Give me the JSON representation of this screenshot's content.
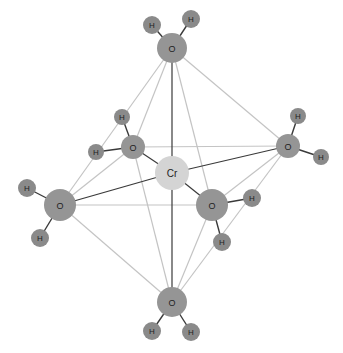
{
  "title": "Hexaaquachromium complex [Cr(H2O)6] octahedral structure",
  "colors": {
    "background": "#ffffff",
    "cr_fill": "#d4d4d4",
    "o_fill": "#959595",
    "h_fill": "#8a8a8a",
    "bond_dark": "#3a3a3a",
    "edge_light": "#c4c4c4",
    "label": "#222222"
  },
  "atoms": [
    {
      "id": "cr",
      "label": "Cr",
      "x": 172,
      "y": 173,
      "r": 17,
      "type": "cr"
    },
    {
      "id": "o_top",
      "label": "O",
      "x": 172,
      "y": 48,
      "r": 15,
      "type": "o"
    },
    {
      "id": "o_bottom",
      "label": "O",
      "x": 172,
      "y": 302,
      "r": 15,
      "type": "o"
    },
    {
      "id": "o_left",
      "label": "O",
      "x": 60,
      "y": 205,
      "r": 16,
      "type": "o"
    },
    {
      "id": "o_right",
      "label": "O",
      "x": 288,
      "y": 146,
      "r": 12,
      "type": "o"
    },
    {
      "id": "o_back",
      "label": "O",
      "x": 133,
      "y": 147,
      "r": 12,
      "type": "o"
    },
    {
      "id": "o_front",
      "label": "O",
      "x": 212,
      "y": 205,
      "r": 16,
      "type": "o"
    },
    {
      "id": "h_top_1",
      "label": "H",
      "x": 152,
      "y": 25,
      "r": 9,
      "type": "h"
    },
    {
      "id": "h_top_2",
      "label": "H",
      "x": 191,
      "y": 19,
      "r": 9,
      "type": "h"
    },
    {
      "id": "h_back_1",
      "label": "H",
      "x": 122,
      "y": 117,
      "r": 8,
      "type": "h"
    },
    {
      "id": "h_back_2",
      "label": "H",
      "x": 96,
      "y": 152,
      "r": 8,
      "type": "h"
    },
    {
      "id": "h_right_1",
      "label": "H",
      "x": 298,
      "y": 116,
      "r": 8,
      "type": "h"
    },
    {
      "id": "h_right_2",
      "label": "H",
      "x": 321,
      "y": 157,
      "r": 8,
      "type": "h"
    },
    {
      "id": "h_left_1",
      "label": "H",
      "x": 27,
      "y": 188,
      "r": 9,
      "type": "h"
    },
    {
      "id": "h_left_2",
      "label": "H",
      "x": 40,
      "y": 238,
      "r": 9,
      "type": "h"
    },
    {
      "id": "h_front_1",
      "label": "H",
      "x": 252,
      "y": 198,
      "r": 9,
      "type": "h"
    },
    {
      "id": "h_front_2",
      "label": "H",
      "x": 222,
      "y": 242,
      "r": 9,
      "type": "h"
    },
    {
      "id": "h_bottom_1",
      "label": "H",
      "x": 152,
      "y": 331,
      "r": 9,
      "type": "h"
    },
    {
      "id": "h_bottom_2",
      "label": "H",
      "x": 191,
      "y": 332,
      "r": 9,
      "type": "h"
    }
  ],
  "edges": [
    {
      "from": "o_top",
      "to": "o_left"
    },
    {
      "from": "o_top",
      "to": "o_back"
    },
    {
      "from": "o_top",
      "to": "o_right"
    },
    {
      "from": "o_top",
      "to": "o_front"
    },
    {
      "from": "o_bottom",
      "to": "o_left"
    },
    {
      "from": "o_bottom",
      "to": "o_back"
    },
    {
      "from": "o_bottom",
      "to": "o_right"
    },
    {
      "from": "o_bottom",
      "to": "o_front"
    },
    {
      "from": "o_left",
      "to": "o_back"
    },
    {
      "from": "o_left",
      "to": "o_front"
    },
    {
      "from": "o_back",
      "to": "o_right"
    },
    {
      "from": "o_right",
      "to": "o_front"
    }
  ],
  "cr_bonds": [
    {
      "from": "cr",
      "to": "o_top"
    },
    {
      "from": "cr",
      "to": "o_bottom"
    },
    {
      "from": "cr",
      "to": "o_left"
    },
    {
      "from": "cr",
      "to": "o_right"
    },
    {
      "from": "cr",
      "to": "o_back"
    },
    {
      "from": "cr",
      "to": "o_front"
    }
  ],
  "oh_bonds": [
    {
      "from": "o_top",
      "to": "h_top_1"
    },
    {
      "from": "o_top",
      "to": "h_top_2"
    },
    {
      "from": "o_back",
      "to": "h_back_1"
    },
    {
      "from": "o_back",
      "to": "h_back_2"
    },
    {
      "from": "o_right",
      "to": "h_right_1"
    },
    {
      "from": "o_right",
      "to": "h_right_2"
    },
    {
      "from": "o_left",
      "to": "h_left_1"
    },
    {
      "from": "o_left",
      "to": "h_left_2"
    },
    {
      "from": "o_front",
      "to": "h_front_1"
    },
    {
      "from": "o_front",
      "to": "h_front_2"
    },
    {
      "from": "o_bottom",
      "to": "h_bottom_1"
    },
    {
      "from": "o_bottom",
      "to": "h_bottom_2"
    }
  ]
}
